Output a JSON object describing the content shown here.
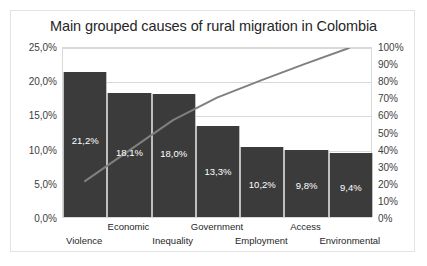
{
  "chart_data": {
    "type": "bar",
    "title": "Main grouped causes of rural migration in Colombia",
    "subtitle": "",
    "xlabel": "",
    "ylabel": "",
    "categories": [
      "Violence",
      "Economic",
      "Inequality",
      "Government",
      "Employment",
      "Access",
      "Environmental"
    ],
    "values": [
      21.2,
      18.1,
      18.0,
      13.3,
      10.2,
      9.8,
      9.4
    ],
    "data_labels": [
      "21,2%",
      "18,1%",
      "18,0%",
      "13,3%",
      "10,2%",
      "9,8%",
      "9,4%"
    ],
    "series": [
      {
        "name": "Percentage",
        "type": "bar",
        "axis": "left",
        "values": [
          21.2,
          18.1,
          18.0,
          13.3,
          10.2,
          9.8,
          9.4
        ],
        "color": "#3b3b3b"
      },
      {
        "name": "Cumulative",
        "type": "line",
        "axis": "right",
        "values": [
          21.2,
          39.3,
          57.3,
          70.6,
          80.8,
          90.6,
          100.0
        ],
        "color": "#808080"
      }
    ],
    "ylim": [
      0,
      25
    ],
    "ylim_secondary": [
      0,
      100
    ],
    "ytick_labels_left": [
      "0,0%",
      "5,0%",
      "10,0%",
      "15,0%",
      "20,0%",
      "25,0%"
    ],
    "ytick_values_left": [
      0,
      5,
      10,
      15,
      20,
      25
    ],
    "ytick_labels_right": [
      "0%",
      "10%",
      "20%",
      "30%",
      "40%",
      "50%",
      "60%",
      "70%",
      "80%",
      "90%",
      "100%"
    ],
    "ytick_values_right": [
      0,
      10,
      20,
      30,
      40,
      50,
      60,
      70,
      80,
      90,
      100
    ],
    "grid": true,
    "grid_axis": "y",
    "legend": false,
    "legend_position": "none",
    "decimal_separator": ",",
    "colors": {
      "bar": "#3b3b3b",
      "line": "#808080",
      "grid": "#d9d9d9",
      "frame": "#e3e3e3",
      "background": "#ffffff",
      "text": "#262626",
      "data_label_text": "#ffffff"
    }
  }
}
